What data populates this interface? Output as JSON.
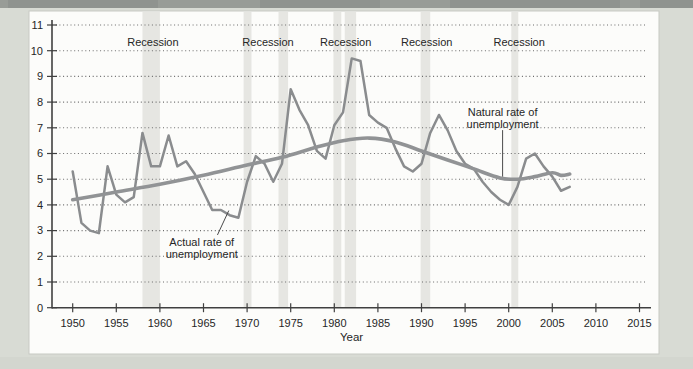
{
  "figure": {
    "type": "textbook-line-chart",
    "x_axis_title": "Year"
  },
  "colors": {
    "page_background": "#d8dbd4",
    "page_top_strip": "#989c97",
    "page_top_strip_patch": "#868a85",
    "page_bottom_band": "#cfd2cb",
    "panel_background": "#fcfcfa",
    "panel_border": "#c7cac3",
    "recession_band": "#e6e6e2",
    "gridline": "#6b6b6b",
    "axis": "#404040",
    "text": "#262626",
    "actual_line": "#8a8c8e",
    "natural_line": "#919395",
    "annotation_pointer": "#4a4a4a"
  },
  "chart_data": {
    "type": "line",
    "title": "",
    "xlabel": "Year",
    "ylabel": "",
    "grid": "dotted-horizontal",
    "legend_position": "none (inline annotations)",
    "x_axis": {
      "min": 1950,
      "max": 2015
    },
    "y_axis": {
      "min": 0,
      "max": 11
    },
    "x_ticks": [
      1950,
      1955,
      1960,
      1965,
      1970,
      1975,
      1980,
      1985,
      1990,
      1995,
      2000,
      2005,
      2010,
      2015
    ],
    "y_ticks": [
      0,
      1,
      2,
      3,
      4,
      5,
      6,
      7,
      8,
      9,
      10,
      11
    ],
    "series": [
      {
        "name": "Actual rate of unemployment",
        "color": "#8a8c8e",
        "stroke_width": 2.5,
        "smooth": false,
        "x_start": 1950,
        "x_step": 1,
        "values": [
          5.3,
          3.3,
          3.0,
          2.9,
          5.5,
          4.4,
          4.1,
          4.3,
          6.8,
          5.5,
          5.5,
          6.7,
          5.5,
          5.7,
          5.2,
          4.5,
          3.8,
          3.8,
          3.6,
          3.5,
          4.9,
          5.9,
          5.6,
          4.9,
          5.6,
          8.5,
          7.7,
          7.1,
          6.1,
          5.8,
          7.1,
          7.6,
          9.7,
          9.6,
          7.5,
          7.2,
          7.0,
          6.2,
          5.5,
          5.3,
          5.6,
          6.8,
          7.5,
          6.9,
          6.1,
          5.6,
          5.4,
          4.9,
          4.5,
          4.2,
          4.0,
          4.7,
          5.8,
          6.0,
          5.5,
          5.1,
          4.55,
          4.7
        ]
      },
      {
        "name": "Natural rate of unemployment",
        "color": "#919395",
        "stroke_width": 3.6,
        "smooth": true,
        "points": [
          [
            1950,
            4.2
          ],
          [
            1955,
            4.5
          ],
          [
            1960,
            4.8
          ],
          [
            1965,
            5.15
          ],
          [
            1970,
            5.55
          ],
          [
            1974,
            5.85
          ],
          [
            1978,
            6.25
          ],
          [
            1981,
            6.5
          ],
          [
            1984,
            6.6
          ],
          [
            1987,
            6.45
          ],
          [
            1990,
            6.1
          ],
          [
            1993,
            5.75
          ],
          [
            1996,
            5.4
          ],
          [
            1999,
            5.05
          ],
          [
            2001,
            5.0
          ],
          [
            2003,
            5.1
          ],
          [
            2005,
            5.25
          ],
          [
            2006,
            5.15
          ],
          [
            2007,
            5.2
          ]
        ]
      }
    ],
    "recessions": [
      {
        "start": 1958.0,
        "end": 1960.0
      },
      {
        "start": 1969.6,
        "end": 1970.5
      },
      {
        "start": 1973.6,
        "end": 1974.7
      },
      {
        "start": 1979.9,
        "end": 1980.8
      },
      {
        "start": 1981.2,
        "end": 1982.5
      },
      {
        "start": 1989.9,
        "end": 1991.0
      },
      {
        "start": 2000.3,
        "end": 2001.1
      }
    ],
    "recession_labels": [
      {
        "text": "Recession",
        "year": 1959.2
      },
      {
        "text": "Recession",
        "year": 1972.4
      },
      {
        "text": "Recession",
        "year": 1981.3
      },
      {
        "text": "Recession",
        "year": 1990.6
      },
      {
        "text": "Recession",
        "year": 2001.2
      }
    ],
    "annotations": [
      {
        "id": "actual-rate",
        "lines": [
          "Actual rate of",
          "unemployment"
        ],
        "anchor_year": 1964.8,
        "anchor_value": 2.56,
        "pointer": [
          [
            1966.6,
            2.83
          ],
          [
            1967.9,
            3.78
          ]
        ]
      },
      {
        "id": "natural-rate",
        "lines": [
          "Natural rate of",
          "unemployment"
        ],
        "anchor_year": 1999.3,
        "anchor_value": 7.62,
        "pointer": [
          [
            1999.3,
            6.91
          ],
          [
            1999.3,
            5.1
          ]
        ]
      }
    ]
  }
}
